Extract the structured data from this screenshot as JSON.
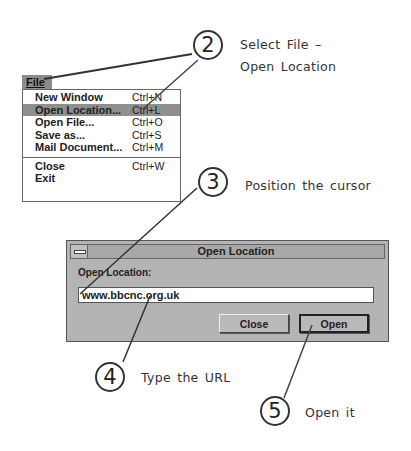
{
  "menu": {
    "title": "File",
    "items": [
      {
        "label": "New Window",
        "shortcut": "Ctrl+N",
        "highlighted": false
      },
      {
        "label": "Open Location...",
        "shortcut": "Ctrl+L",
        "highlighted": true
      },
      {
        "label": "Open File...",
        "shortcut": "Ctrl+O",
        "highlighted": false
      },
      {
        "label": "Save as...",
        "shortcut": "Ctrl+S",
        "highlighted": false
      },
      {
        "label": "Mail Document...",
        "shortcut": "Ctrl+M",
        "highlighted": false
      },
      {
        "label": "Close",
        "shortcut": "Ctrl+W",
        "highlighted": false
      },
      {
        "label": "Exit",
        "shortcut": "",
        "highlighted": false
      }
    ]
  },
  "dialog": {
    "title": "Open Location",
    "field_label": "Open Location:",
    "url_value": "www.bbcnc.org.uk",
    "close_label": "Close",
    "open_label": "Open"
  },
  "callouts": [
    {
      "number": "2",
      "text_line1": "Select File –",
      "text_line2": "Open Location"
    },
    {
      "number": "3",
      "text": "Position the cursor"
    },
    {
      "number": "4",
      "text": "Type the URL"
    },
    {
      "number": "5",
      "text": "Open it"
    }
  ],
  "colors": {
    "menu_highlight": "#8f8f8f",
    "dialog_bg": "#b4b4b4",
    "callout_stroke": "#333333"
  }
}
